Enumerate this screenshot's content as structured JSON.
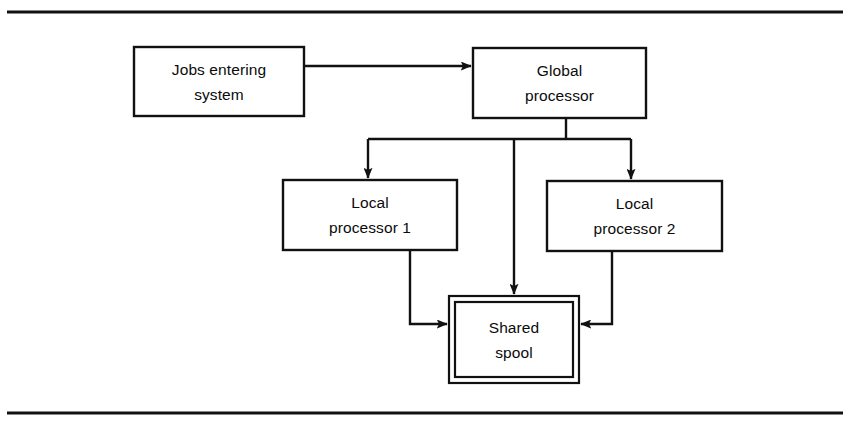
{
  "figure": {
    "kind": "block-flow-diagram",
    "background_color": "#ffffff",
    "line_color": "#111111",
    "text_color": "#0b0b0b",
    "rules": {
      "top_rule": "horizontal rule",
      "bottom_rule": "horizontal rule"
    }
  },
  "nodes": [
    {
      "id": "jobs",
      "name": "jobs-entering-system",
      "lines": [
        "Jobs entering",
        "system"
      ],
      "shape": "rectangle",
      "border": "single"
    },
    {
      "id": "global",
      "name": "global-processor",
      "lines": [
        "Global",
        "processor"
      ],
      "shape": "rectangle",
      "border": "single"
    },
    {
      "id": "local1",
      "name": "local-processor-1",
      "lines": [
        "Local",
        "processor 1"
      ],
      "shape": "rectangle",
      "border": "single"
    },
    {
      "id": "local2",
      "name": "local-processor-2",
      "lines": [
        "Local",
        "processor 2"
      ],
      "shape": "rectangle",
      "border": "single"
    },
    {
      "id": "spool",
      "name": "shared-spool",
      "lines": [
        "Shared",
        "spool"
      ],
      "shape": "rectangle",
      "border": "double"
    }
  ],
  "edges": [
    {
      "id": "e1",
      "name": "jobs-to-global",
      "from": "jobs",
      "to": "global",
      "style": "straight-arrow",
      "direction": "right"
    },
    {
      "id": "e2",
      "name": "global-to-local1",
      "from": "global",
      "to": "local1",
      "style": "elbow-arrow",
      "direction": "down"
    },
    {
      "id": "e3",
      "name": "global-to-spool",
      "from": "global",
      "to": "spool",
      "style": "straight-arrow",
      "direction": "down"
    },
    {
      "id": "e4",
      "name": "global-to-local2",
      "from": "global",
      "to": "local2",
      "style": "elbow-arrow",
      "direction": "down"
    },
    {
      "id": "e5",
      "name": "local1-to-spool",
      "from": "local1",
      "to": "spool",
      "style": "elbow-arrow",
      "direction": "right"
    },
    {
      "id": "e6",
      "name": "local2-to-spool",
      "from": "local2",
      "to": "spool",
      "style": "elbow-arrow",
      "direction": "left"
    }
  ]
}
